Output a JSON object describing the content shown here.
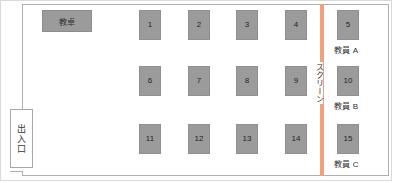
{
  "diagram": {
    "room": {
      "door": {
        "label": "出入口"
      },
      "teacher_desk": {
        "label": "教卓"
      },
      "screen": {
        "label": "スクリーン",
        "color": "#f0a07c"
      }
    },
    "seat_fill_color": "#9b9b9b",
    "seats": [
      {
        "number": "1",
        "x": 139,
        "y": 10,
        "row": 1,
        "col": 1
      },
      {
        "number": "2",
        "x": 188,
        "y": 10,
        "row": 1,
        "col": 2
      },
      {
        "number": "3",
        "x": 236,
        "y": 10,
        "row": 1,
        "col": 3
      },
      {
        "number": "4",
        "x": 285,
        "y": 10,
        "row": 1,
        "col": 4
      },
      {
        "number": "5",
        "x": 337,
        "y": 10,
        "row": 1,
        "col": 5
      },
      {
        "number": "6",
        "x": 139,
        "y": 66,
        "row": 2,
        "col": 1
      },
      {
        "number": "7",
        "x": 188,
        "y": 66,
        "row": 2,
        "col": 2
      },
      {
        "number": "8",
        "x": 236,
        "y": 66,
        "row": 2,
        "col": 3
      },
      {
        "number": "9",
        "x": 285,
        "y": 66,
        "row": 2,
        "col": 4
      },
      {
        "number": "10",
        "x": 337,
        "y": 66,
        "row": 2,
        "col": 5
      },
      {
        "number": "11",
        "x": 139,
        "y": 124,
        "row": 3,
        "col": 1
      },
      {
        "number": "12",
        "x": 188,
        "y": 124,
        "row": 3,
        "col": 2
      },
      {
        "number": "13",
        "x": 236,
        "y": 124,
        "row": 3,
        "col": 3
      },
      {
        "number": "14",
        "x": 285,
        "y": 124,
        "row": 3,
        "col": 4
      },
      {
        "number": "15",
        "x": 337,
        "y": 124,
        "row": 3,
        "col": 5
      }
    ],
    "staff_captions": [
      {
        "label": "教員 A",
        "seat": "5",
        "x": 334,
        "y": 44
      },
      {
        "label": "教員 B",
        "seat": "10",
        "x": 334,
        "y": 100
      },
      {
        "label": "教員 C",
        "seat": "15",
        "x": 334,
        "y": 158
      }
    ]
  }
}
